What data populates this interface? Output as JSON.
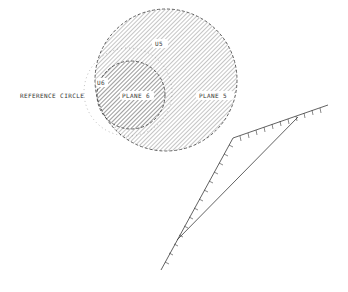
{
  "diagram": {
    "labels": {
      "reference_circle": "REFERENCE CIRCLE",
      "plane_6": "PLANE 6",
      "plane_5": "PLANE 5",
      "us_top": "U5",
      "us_left": "U6"
    },
    "colors": {
      "line": "#3a3a3a",
      "hatch": "#6e6e6e",
      "background": "#ffffff"
    },
    "shapes": {
      "large_circle": {
        "cx": 166,
        "cy": 80,
        "r": 71,
        "style": "dashed-hatched"
      },
      "small_circle": {
        "cx": 131,
        "cy": 95,
        "r": 34,
        "style": "dashed"
      },
      "reference_circle": {
        "cx": 128,
        "cy": 92,
        "r": 44,
        "style": "dotted"
      }
    }
  }
}
